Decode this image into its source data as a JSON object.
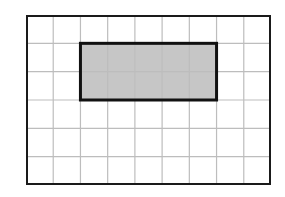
{
  "diagram": {
    "type": "grid-with-shaded-rectangle",
    "grid": {
      "columns": 9,
      "rows": 6,
      "line_color": "#bdbdbd",
      "border_color": "#1a1a1a"
    },
    "shaded_rectangle": {
      "col_start": 2,
      "row_start": 1,
      "width_cells": 5,
      "height_cells": 2,
      "fill_color": "#c6c6c6",
      "border_color": "#111111"
    }
  }
}
